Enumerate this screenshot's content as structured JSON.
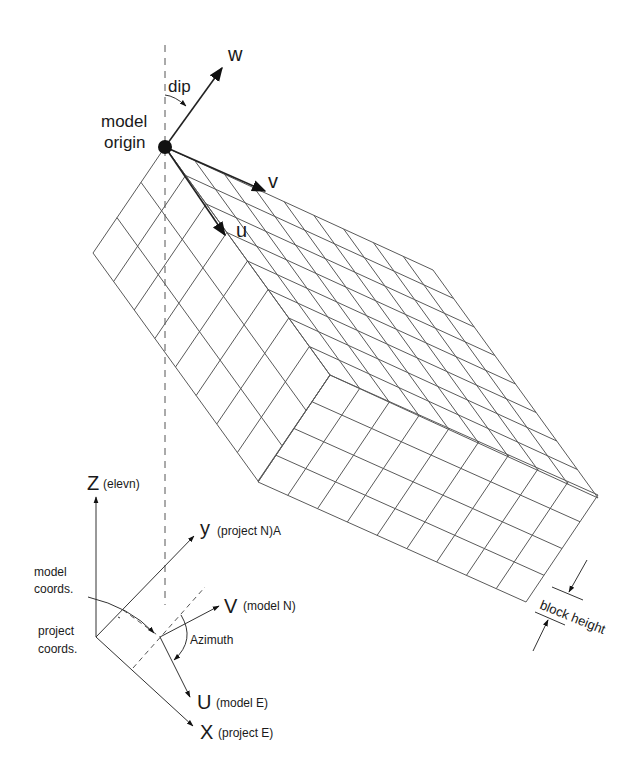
{
  "figure": {
    "labels": {
      "w": "w",
      "dip": "dip",
      "model_origin_1": "model",
      "model_origin_2": "origin",
      "v": "v",
      "u": "u",
      "z_axis": "Z",
      "z_axis_note": "(elevn)",
      "y_axis": "y",
      "y_axis_note": "(project N)A",
      "model_coords_1": "model",
      "model_coords_2": "coords.",
      "project_coords_1": "project",
      "project_coords_2": "coords.",
      "v_model": "V",
      "v_model_note": "(model N)",
      "azimuth": "Azimuth",
      "u_model": "U",
      "u_model_note": "(model E)",
      "x_axis": "X",
      "x_axis_note": "(project E)",
      "block_height": "block height"
    },
    "block": {
      "origin": [
        165,
        147
      ],
      "left_corner": [
        93,
        253
      ],
      "top_right_corner": [
        433,
        270
      ],
      "far_corner": [
        598,
        495
      ],
      "front_top_corner": [
        330,
        375
      ],
      "front_bottom_corner": [
        258,
        482
      ],
      "bottom_right_corner": [
        526,
        603
      ],
      "top_face_divisions": {
        "u": 8,
        "v": 9
      },
      "left_face_divisions": {
        "short": 3,
        "long": 8
      },
      "front_face_divisions": {
        "long": 9,
        "short": 4
      }
    },
    "colors": {
      "line": "#3a3a3a",
      "grid": "#5a5a5a",
      "background": "#ffffff"
    }
  }
}
